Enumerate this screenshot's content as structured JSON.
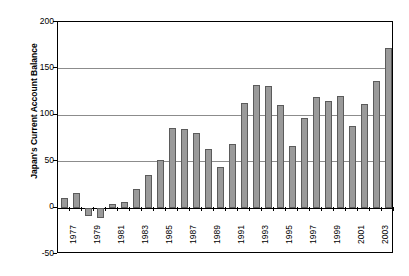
{
  "chart_data": {
    "type": "bar",
    "title": "",
    "subtitle": "",
    "xlabel": "",
    "ylabel": "Japan's Current Account Balance",
    "ylim": [
      -50,
      200
    ],
    "yticks": [
      200,
      150,
      100,
      50,
      0,
      -50
    ],
    "ytick_labels": [
      "200",
      "150",
      "100",
      "50",
      "0",
      "-50"
    ],
    "grid": true,
    "gridlines_at": [
      150,
      100,
      50
    ],
    "legend": null,
    "legend_position": "none",
    "bar_color": "#9a9a9a",
    "bar_edge_color": "#5b5b5b",
    "axis_color": "#000000",
    "categories": [
      "1977",
      "1978",
      "1979",
      "1980",
      "1981",
      "1982",
      "1983",
      "1984",
      "1985",
      "1986",
      "1987",
      "1988",
      "1989",
      "1990",
      "1991",
      "1992",
      "1993",
      "1994",
      "1995",
      "1996",
      "1997",
      "1998",
      "1999",
      "2000",
      "2001",
      "2002",
      "2003",
      "2004"
    ],
    "xtick_labels_shown": [
      "1977",
      "1979",
      "1981",
      "1983",
      "1985",
      "1987",
      "1989",
      "1991",
      "1993",
      "1995",
      "1997",
      "1999",
      "2001",
      "2003"
    ],
    "values": [
      10,
      16,
      -9,
      -11,
      4,
      6,
      20,
      35,
      51,
      86,
      85,
      80,
      63,
      44,
      68,
      113,
      132,
      131,
      111,
      66,
      97,
      119,
      115,
      120,
      88,
      112,
      136,
      172
    ]
  }
}
